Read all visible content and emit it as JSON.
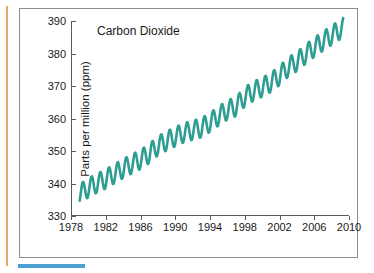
{
  "figure": {
    "title": "Carbon Dioxide",
    "ylabel": "Parts per million (ppm)",
    "line_color": "#2e9d92",
    "frame_color": "#8d8d8d",
    "left_rule_color": "#e8a866",
    "bottom_rule_color": "#4d9fd1"
  },
  "chart_data": {
    "type": "line",
    "title": "Carbon Dioxide",
    "xlabel": "",
    "ylabel": "Parts per million (ppm)",
    "xlim": [
      1978,
      2010
    ],
    "ylim": [
      330,
      390
    ],
    "xticks": [
      1978,
      1982,
      1986,
      1990,
      1994,
      1998,
      2002,
      2006,
      2010
    ],
    "xtick_labels": [
      "1978",
      "1982",
      "1986",
      "1990",
      "1994",
      "1998",
      "2002",
      "2006",
      "2010"
    ],
    "yticks": [
      330,
      340,
      350,
      360,
      370,
      380,
      390
    ],
    "ytick_labels": [
      "330",
      "340",
      "350",
      "360",
      "370",
      "380",
      "390"
    ],
    "grid": false,
    "legend": false,
    "series": [
      {
        "name": "Carbon Dioxide",
        "color": "#2e9d92",
        "description": "Monthly mean atmospheric CO2 concentration with seasonal oscillation of about 6 ppm superimposed on a rising trend",
        "annual_trend": {
          "x": [
            1979,
            1980,
            1981,
            1982,
            1983,
            1984,
            1985,
            1986,
            1987,
            1988,
            1989,
            1990,
            1991,
            1992,
            1993,
            1994,
            1995,
            1996,
            1997,
            1998,
            1999,
            2000,
            2001,
            2002,
            2003,
            2004,
            2005,
            2006,
            2007,
            2008,
            2009
          ],
          "y": [
            336.8,
            338.7,
            340.1,
            341.4,
            343.0,
            344.6,
            346.0,
            347.4,
            349.2,
            351.6,
            353.1,
            354.4,
            355.6,
            356.4,
            357.1,
            358.8,
            360.8,
            362.6,
            363.7,
            366.7,
            368.4,
            369.6,
            371.1,
            373.2,
            375.8,
            377.5,
            379.8,
            381.9,
            383.8,
            385.6,
            387.4
          ]
        },
        "seasonal_amplitude_ppm": 6.0,
        "seasonal_peak_month": 5,
        "seasonal_trough_month": 10,
        "start_year": 1979.0,
        "end_year": 2009.4,
        "start_value": 336.0,
        "end_value": 386.5
      }
    ]
  }
}
